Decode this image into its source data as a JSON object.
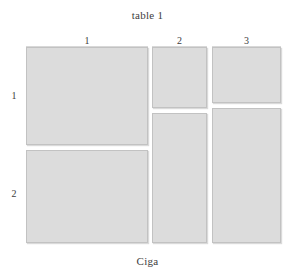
{
  "figure": {
    "title": "table 1",
    "caption": "Ciga",
    "background_color": "#ffffff",
    "cell_fill_color": "#dcdcdc",
    "cell_border_color": "#c2c2c2",
    "text_color": "#3d3d3d"
  },
  "column_headers": [
    {
      "label": "1",
      "left": 26,
      "width": 122
    },
    {
      "label": "2",
      "left": 152,
      "width": 55
    },
    {
      "label": "3",
      "left": 212,
      "width": 69
    }
  ],
  "row_headers": [
    {
      "label": "1",
      "top": 90
    },
    {
      "label": "2",
      "top": 188
    }
  ],
  "cells": [
    {
      "name": "cell-r1-c1",
      "column": "1",
      "row": "1",
      "left": 26,
      "top": 47,
      "width": 122,
      "height": 98
    },
    {
      "name": "cell-r2-c1",
      "column": "1",
      "row": "2",
      "left": 26,
      "top": 150,
      "width": 122,
      "height": 93
    },
    {
      "name": "cell-r1-c2",
      "column": "2",
      "row": "1",
      "left": 152,
      "top": 47,
      "width": 55,
      "height": 61
    },
    {
      "name": "cell-r2-c2",
      "column": "2",
      "row": "2",
      "left": 152,
      "top": 113,
      "width": 55,
      "height": 130
    },
    {
      "name": "cell-r1-c3",
      "column": "3",
      "row": "1",
      "left": 212,
      "top": 47,
      "width": 69,
      "height": 56
    },
    {
      "name": "cell-r2-c3",
      "column": "3",
      "row": "2",
      "left": 212,
      "top": 108,
      "width": 69,
      "height": 135
    }
  ],
  "header_rules": [
    {
      "name": "header-rule-1",
      "left": 26,
      "top": 46,
      "width": 122
    },
    {
      "name": "header-rule-2",
      "left": 152,
      "top": 46,
      "width": 55
    },
    {
      "name": "header-rule-3",
      "left": 212,
      "top": 46,
      "width": 69
    }
  ]
}
